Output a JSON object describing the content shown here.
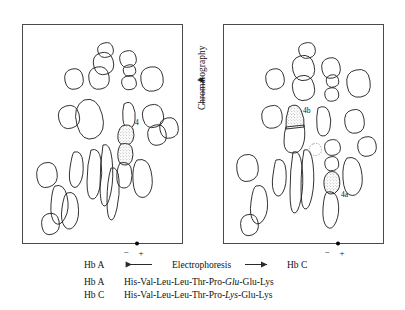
{
  "figure": {
    "axis_labels": {
      "chromatography": "Chromatography",
      "electrophoresis": "Electrophoresis"
    },
    "panels": [
      {
        "id": "left",
        "sample_label": "Hb A",
        "polarity_minus": "−",
        "polarity_plus": "+",
        "spot_labels": [
          "4"
        ]
      },
      {
        "id": "right",
        "sample_label": "Hb C",
        "polarity_minus": "−",
        "polarity_plus": "+",
        "spot_labels": [
          "4b",
          "4a"
        ]
      }
    ],
    "sequences": [
      {
        "name": "Hb A",
        "pre": "His-Val-Leu-Leu-Thr-Pro-",
        "highlight": "Glu",
        "post": "-Glu-Lys"
      },
      {
        "name": "Hb C",
        "pre": "His-Val-Leu-Leu-Thr-Pro-",
        "highlight": "Lys",
        "post": "-Glu-Lys"
      }
    ],
    "colors": {
      "background": "#ffffff",
      "frame": "#4a4a4a",
      "spot_outline": "#1c1c1c",
      "text": "#111111",
      "stipple": "#6e6e6e"
    }
  }
}
